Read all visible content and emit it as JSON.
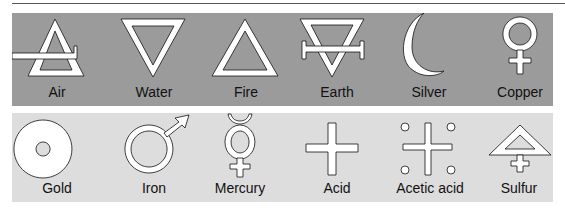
{
  "figure": {
    "colors": {
      "top_panel": "#9b9b9b",
      "bottom_panel": "#dddddd",
      "symbol_fill": "#ffffff",
      "symbol_stroke": "#111111"
    },
    "rows": [
      {
        "symbols": [
          {
            "label": "Air",
            "icon": "air-symbol"
          },
          {
            "label": "Water",
            "icon": "water-symbol"
          },
          {
            "label": "Fire",
            "icon": "fire-symbol"
          },
          {
            "label": "Earth",
            "icon": "earth-symbol"
          },
          {
            "label": "Silver",
            "icon": "silver-symbol"
          },
          {
            "label": "Copper",
            "icon": "copper-symbol"
          }
        ]
      },
      {
        "symbols": [
          {
            "label": "Gold",
            "icon": "gold-symbol"
          },
          {
            "label": "Iron",
            "icon": "iron-symbol"
          },
          {
            "label": "Mercury",
            "icon": "mercury-symbol"
          },
          {
            "label": "Acid",
            "icon": "acid-symbol"
          },
          {
            "label": "Acetic acid",
            "icon": "acetic-acid-symbol"
          },
          {
            "label": "Sulfur",
            "icon": "sulfur-symbol"
          }
        ]
      }
    ]
  }
}
